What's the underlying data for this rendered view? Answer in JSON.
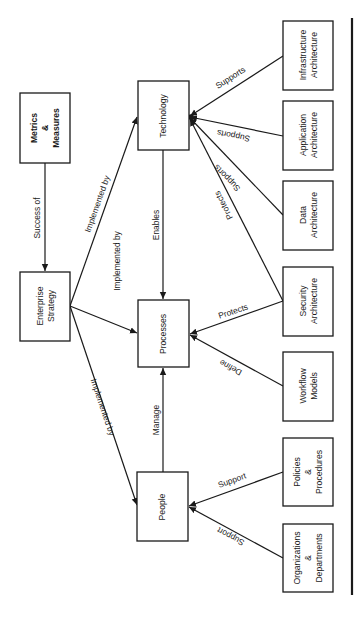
{
  "diagram": {
    "nodes": {
      "metrics": {
        "line1": "Metrics",
        "line2": "&",
        "line3": "Measures"
      },
      "strategy": {
        "line1": "Enterprise",
        "line2": "Strategy"
      },
      "technology": {
        "line1": "Technology"
      },
      "processes": {
        "line1": "Processes"
      },
      "people": {
        "line1": "People"
      },
      "infrastructure": {
        "line1": "Infrastructure",
        "line2": "Architecture"
      },
      "application": {
        "line1": "Application",
        "line2": "Architecture"
      },
      "data": {
        "line1": "Data",
        "line2": "Architecture"
      },
      "security": {
        "line1": "Security",
        "line2": "Architecture"
      },
      "workflow": {
        "line1": "Workflow",
        "line2": "Models"
      },
      "policies": {
        "line1": "Policies",
        "line2": "&",
        "line3": "Procedures"
      },
      "organizations": {
        "line1": "Organizations",
        "line2": "&",
        "line3": "Departments"
      }
    },
    "edges": {
      "metrics_strategy": "Success of",
      "strategy_technology": "Implemented by",
      "strategy_processes": "Implemented by",
      "strategy_people": "Implemented by",
      "technology_processes": "Enables",
      "people_processes": "Manage",
      "infrastructure_technology": "Supports",
      "application_technology": "Supports",
      "data_technology": "Supports",
      "security_technology": "Protects",
      "security_processes": "Protects",
      "workflow_processes": "Define",
      "policies_people": "Support",
      "organizations_people": "Support"
    }
  }
}
